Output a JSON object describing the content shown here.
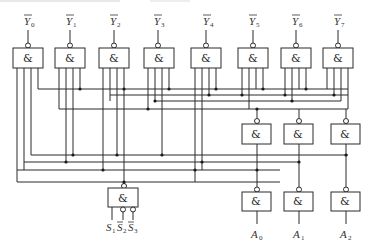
{
  "diagram": {
    "gate_symbol": "&",
    "outputs": [
      {
        "name": "Y",
        "sub": "0",
        "bar": true
      },
      {
        "name": "Y",
        "sub": "1",
        "bar": true
      },
      {
        "name": "Y",
        "sub": "2",
        "bar": true
      },
      {
        "name": "Y",
        "sub": "3",
        "bar": true
      },
      {
        "name": "Y",
        "sub": "4",
        "bar": true
      },
      {
        "name": "Y",
        "sub": "5",
        "bar": true
      },
      {
        "name": "Y",
        "sub": "6",
        "bar": true
      },
      {
        "name": "Y",
        "sub": "7",
        "bar": true
      }
    ],
    "address_inputs": [
      {
        "name": "A",
        "sub": "0"
      },
      {
        "name": "A",
        "sub": "1"
      },
      {
        "name": "A",
        "sub": "2"
      }
    ],
    "enable_inputs": [
      {
        "name": "S",
        "sub": "1",
        "bar": false
      },
      {
        "name": "S",
        "sub": "2",
        "bar": true
      },
      {
        "name": "S",
        "sub": "3",
        "bar": true
      }
    ],
    "colors": {
      "line": "#2a2a2a",
      "background": "#ffffff"
    }
  }
}
